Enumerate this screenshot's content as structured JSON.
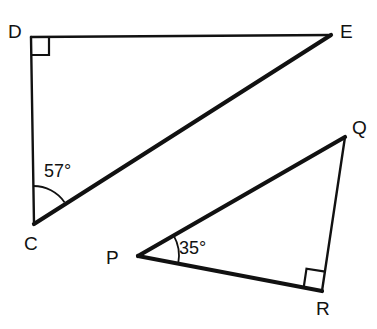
{
  "figure": {
    "background_color": "#ffffff",
    "stroke_color": "#111111",
    "width": 377,
    "height": 329
  },
  "triangles": [
    {
      "name": "triangle-cde",
      "vertices": [
        {
          "id": "D",
          "label": "D",
          "x": 31,
          "y": 37,
          "label_x": 8,
          "label_y": 38
        },
        {
          "id": "E",
          "label": "E",
          "x": 331,
          "y": 35,
          "label_x": 340,
          "label_y": 38
        },
        {
          "id": "C",
          "label": "C",
          "x": 34,
          "y": 224,
          "label_x": 24,
          "label_y": 250
        }
      ],
      "sides": [
        {
          "name": "side-DE",
          "from": "D",
          "to": "E",
          "weight": "thin"
        },
        {
          "name": "side-DC",
          "from": "D",
          "to": "C",
          "weight": "thin"
        },
        {
          "name": "side-CE",
          "from": "C",
          "to": "E",
          "weight": "thick"
        }
      ],
      "angles": [
        {
          "name": "angle-C",
          "vertex": "C",
          "value": "57°",
          "label_x": 44,
          "label_y": 177,
          "arc_radius": 38
        },
        {
          "name": "angle-D",
          "vertex": "D",
          "value": "90°",
          "marker": "right-angle-square",
          "size": 18
        }
      ]
    },
    {
      "name": "triangle-pqr",
      "vertices": [
        {
          "id": "P",
          "label": "P",
          "x": 138,
          "y": 256,
          "label_x": 106,
          "label_y": 264
        },
        {
          "id": "Q",
          "label": "Q",
          "x": 345,
          "y": 137,
          "label_x": 352,
          "label_y": 134
        },
        {
          "id": "R",
          "label": "R",
          "x": 322,
          "y": 291,
          "label_x": 316,
          "label_y": 315
        }
      ],
      "sides": [
        {
          "name": "side-PQ",
          "from": "P",
          "to": "Q",
          "weight": "thick"
        },
        {
          "name": "side-PR",
          "from": "P",
          "to": "R",
          "weight": "thick"
        },
        {
          "name": "side-QR",
          "from": "Q",
          "to": "R",
          "weight": "thin"
        }
      ],
      "angles": [
        {
          "name": "angle-P",
          "vertex": "P",
          "value": "35°",
          "label_x": 179,
          "label_y": 254,
          "arc_radius": 41
        },
        {
          "name": "angle-R",
          "vertex": "R",
          "value": "90°",
          "marker": "right-angle-square",
          "size": 19
        }
      ]
    }
  ],
  "labels": {
    "D": "D",
    "E": "E",
    "C": "C",
    "P": "P",
    "Q": "Q",
    "R": "R",
    "angle_c": "57°",
    "angle_p": "35°"
  }
}
